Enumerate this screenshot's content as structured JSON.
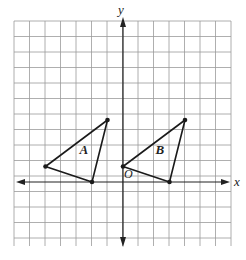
{
  "figure": {
    "axes": {
      "x_label": "x",
      "y_label": "y",
      "origin_label": "O",
      "x_range": [
        -7,
        7
      ],
      "y_range": [
        -3,
        8
      ],
      "grid": true
    },
    "triangles": [
      {
        "label": "A",
        "vertices": [
          [
            -1,
            4
          ],
          [
            -5,
            1
          ],
          [
            -2,
            0
          ]
        ],
        "label_position": [
          -2.8,
          1.8
        ]
      },
      {
        "label": "B",
        "vertices": [
          [
            4,
            4
          ],
          [
            0,
            1
          ],
          [
            3,
            0
          ]
        ],
        "label_position": [
          2.1,
          1.8
        ]
      }
    ],
    "colors": {
      "grid": "#9a9a9a",
      "axis": "#222222",
      "shape": "#1a1a1a"
    }
  }
}
